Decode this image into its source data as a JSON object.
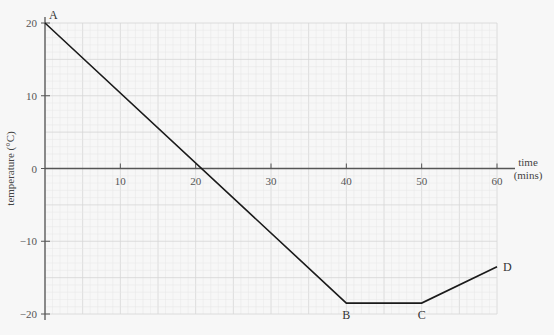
{
  "chart_data": {
    "type": "line",
    "title": "",
    "xlabel": "time (mins)",
    "xlabel_lines": [
      "time",
      "(mins)"
    ],
    "ylabel": "temperature (°C)",
    "xlim": [
      0,
      60
    ],
    "ylim": [
      -20,
      20
    ],
    "x_ticks": [
      10,
      20,
      30,
      40,
      50,
      60
    ],
    "y_ticks": [
      20,
      10,
      0,
      -10,
      -20
    ],
    "grid": true,
    "legend": null,
    "series": [
      {
        "name": "temperature",
        "x": [
          0,
          40,
          50,
          60
        ],
        "y": [
          20,
          -18.5,
          -18.5,
          -13.5
        ],
        "point_labels": [
          "A",
          "B",
          "C",
          "D"
        ]
      }
    ]
  },
  "colors": {
    "background": "#f7f7f7",
    "grid_minor": "#e6e6e6",
    "grid_major": "#d6d6d6",
    "axis": "#555555",
    "line": "#1a1a1a"
  }
}
